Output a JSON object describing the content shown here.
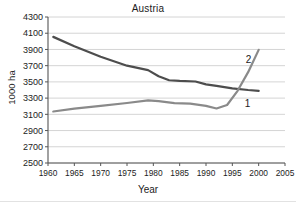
{
  "chart_data": {
    "type": "line",
    "title": "Austria",
    "xlabel": "Year",
    "ylabel": "1000 ha",
    "xlim": [
      1960,
      2005
    ],
    "ylim": [
      2500,
      4300
    ],
    "ytick_step": 200,
    "xtick_step": 5,
    "grid": true,
    "legend_position": "inline-end-labels",
    "xticks": [
      1960,
      1965,
      1970,
      1975,
      1980,
      1985,
      1990,
      1995,
      2000,
      2005
    ],
    "yticks": [
      2500,
      2700,
      2900,
      3100,
      3300,
      3500,
      3700,
      3900,
      4100,
      4300
    ],
    "series": [
      {
        "name": "1",
        "label": "1",
        "color": "#4d4d4d",
        "points": [
          [
            1961,
            4055
          ],
          [
            1965,
            3940
          ],
          [
            1970,
            3810
          ],
          [
            1975,
            3700
          ],
          [
            1979,
            3645
          ],
          [
            1981,
            3570
          ],
          [
            1983,
            3520
          ],
          [
            1985,
            3512
          ],
          [
            1988,
            3505
          ],
          [
            1990,
            3470
          ],
          [
            1992,
            3450
          ],
          [
            1995,
            3420
          ],
          [
            1998,
            3400
          ],
          [
            2000,
            3390
          ]
        ]
      },
      {
        "name": "2",
        "label": "2",
        "color": "#8a8a8a",
        "points": [
          [
            1961,
            3135
          ],
          [
            1965,
            3170
          ],
          [
            1970,
            3205
          ],
          [
            1975,
            3240
          ],
          [
            1979,
            3272
          ],
          [
            1981,
            3262
          ],
          [
            1984,
            3238
          ],
          [
            1987,
            3232
          ],
          [
            1990,
            3205
          ],
          [
            1992,
            3172
          ],
          [
            1994,
            3215
          ],
          [
            1996,
            3390
          ],
          [
            1998,
            3620
          ],
          [
            2000,
            3895
          ]
        ]
      }
    ]
  }
}
